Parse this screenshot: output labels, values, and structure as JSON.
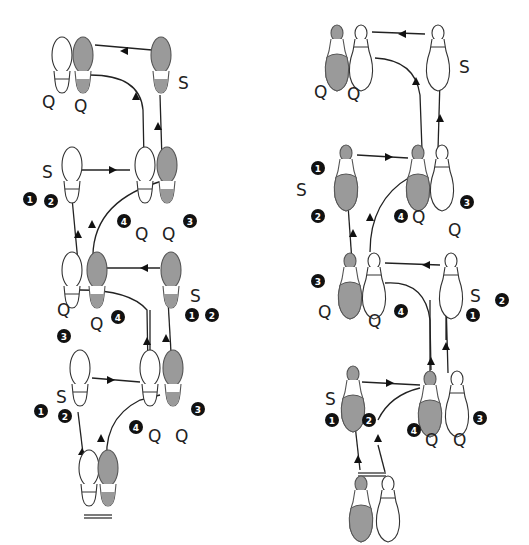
{
  "colors": {
    "gray_foot": "#9a9a9a",
    "white_foot": "#ffffff",
    "ink": "#222222"
  },
  "diagrams": [
    {
      "name": "leader-flat-shoes",
      "footprints": [
        {
          "id": "start-L",
          "x": 85,
          "y": 488,
          "fill": "white"
        },
        {
          "id": "start-R",
          "x": 108,
          "y": 488,
          "fill": "gray"
        },
        {
          "id": "s1-L",
          "x": 80,
          "y": 388,
          "fill": "white"
        },
        {
          "id": "q-L",
          "x": 150,
          "y": 395,
          "fill": "white"
        },
        {
          "id": "q-R",
          "x": 173,
          "y": 390,
          "fill": "gray"
        },
        {
          "id": "m2-L",
          "x": 72,
          "y": 285,
          "fill": "white"
        },
        {
          "id": "m2-R",
          "x": 96,
          "y": 282,
          "fill": "gray"
        },
        {
          "id": "m2-S",
          "x": 170,
          "y": 282,
          "fill": "gray"
        },
        {
          "id": "m3-S",
          "x": 70,
          "y": 180,
          "fill": "white"
        },
        {
          "id": "m3-L",
          "x": 143,
          "y": 180,
          "fill": "white"
        },
        {
          "id": "m3-R",
          "x": 166,
          "y": 180,
          "fill": "gray"
        },
        {
          "id": "top-L",
          "x": 62,
          "y": 80,
          "fill": "white"
        },
        {
          "id": "top-R",
          "x": 84,
          "y": 80,
          "fill": "gray"
        },
        {
          "id": "top-S",
          "x": 162,
          "y": 80,
          "fill": "gray"
        }
      ],
      "labels": [
        {
          "text": "Q",
          "x": 42,
          "y": 108
        },
        {
          "text": "Q",
          "x": 74,
          "y": 112
        },
        {
          "text": "S",
          "x": 178,
          "y": 89
        },
        {
          "text": "S",
          "x": 42,
          "y": 178
        },
        {
          "text": "Q",
          "x": 135,
          "y": 240
        },
        {
          "text": "Q",
          "x": 162,
          "y": 240
        },
        {
          "text": "Q",
          "x": 57,
          "y": 316
        },
        {
          "text": "Q",
          "x": 90,
          "y": 330
        },
        {
          "text": "S",
          "x": 190,
          "y": 302
        },
        {
          "text": "S",
          "x": 52,
          "y": 400
        },
        {
          "text": "Q",
          "x": 148,
          "y": 442
        },
        {
          "text": "Q",
          "x": 175,
          "y": 442
        }
      ],
      "numbers": [
        {
          "n": "1",
          "x": 30,
          "y": 199
        },
        {
          "n": "2",
          "x": 51,
          "y": 201
        },
        {
          "n": "4",
          "x": 124,
          "y": 219
        },
        {
          "n": "3",
          "x": 190,
          "y": 219
        },
        {
          "n": "4",
          "x": 118,
          "y": 321
        },
        {
          "n": "3",
          "x": 64,
          "y": 335
        },
        {
          "n": "1",
          "x": 190,
          "y": 315
        },
        {
          "n": "2",
          "x": 210,
          "y": 315
        },
        {
          "n": "1",
          "x": 41,
          "y": 411
        },
        {
          "n": "2",
          "x": 65,
          "y": 416
        },
        {
          "n": "4",
          "x": 136,
          "y": 427
        },
        {
          "n": "3",
          "x": 198,
          "y": 409
        }
      ]
    },
    {
      "name": "follower-heeled-shoes",
      "footprints": [
        {
          "id": "start-L",
          "x": 358,
          "y": 500,
          "fill": "gray"
        },
        {
          "id": "start-R",
          "x": 388,
          "y": 500,
          "fill": "white"
        },
        {
          "id": "s1",
          "x": 350,
          "y": 393,
          "fill": "gray"
        },
        {
          "id": "q-L",
          "x": 428,
          "y": 400,
          "fill": "gray"
        },
        {
          "id": "q-R",
          "x": 455,
          "y": 400,
          "fill": "white"
        },
        {
          "id": "m2-L",
          "x": 350,
          "y": 280,
          "fill": "gray"
        },
        {
          "id": "m2-R",
          "x": 370,
          "y": 280,
          "fill": "white"
        },
        {
          "id": "m2-S",
          "x": 450,
          "y": 282,
          "fill": "white"
        },
        {
          "id": "m3-S",
          "x": 345,
          "y": 175,
          "fill": "gray"
        },
        {
          "id": "m3-L",
          "x": 418,
          "y": 175,
          "fill": "gray"
        },
        {
          "id": "m3-R",
          "x": 441,
          "y": 175,
          "fill": "white"
        },
        {
          "id": "top-L",
          "x": 338,
          "y": 60,
          "fill": "gray"
        },
        {
          "id": "top-R",
          "x": 362,
          "y": 60,
          "fill": "white"
        },
        {
          "id": "top-S",
          "x": 438,
          "y": 60,
          "fill": "white"
        }
      ],
      "labels": [
        {
          "text": "Q",
          "x": 314,
          "y": 98
        },
        {
          "text": "Q",
          "x": 347,
          "y": 100
        },
        {
          "text": "S",
          "x": 459,
          "y": 73
        },
        {
          "text": "S",
          "x": 296,
          "y": 196
        },
        {
          "text": "Q",
          "x": 412,
          "y": 223
        },
        {
          "text": "Q",
          "x": 448,
          "y": 236
        },
        {
          "text": "Q",
          "x": 318,
          "y": 318
        },
        {
          "text": "Q",
          "x": 368,
          "y": 327
        },
        {
          "text": "S",
          "x": 470,
          "y": 302
        },
        {
          "text": "S",
          "x": 325,
          "y": 405
        },
        {
          "text": "Q",
          "x": 425,
          "y": 446
        },
        {
          "text": "Q",
          "x": 453,
          "y": 446
        }
      ],
      "numbers": [
        {
          "n": "1",
          "x": 318,
          "y": 168
        },
        {
          "n": "2",
          "x": 318,
          "y": 216
        },
        {
          "n": "4",
          "x": 401,
          "y": 216
        },
        {
          "n": "3",
          "x": 467,
          "y": 202
        },
        {
          "n": "3",
          "x": 318,
          "y": 281
        },
        {
          "n": "4",
          "x": 401,
          "y": 311
        },
        {
          "n": "2",
          "x": 502,
          "y": 300
        },
        {
          "n": "1",
          "x": 473,
          "y": 315
        },
        {
          "n": "1",
          "x": 332,
          "y": 420
        },
        {
          "n": "2",
          "x": 369,
          "y": 420
        },
        {
          "n": "4",
          "x": 414,
          "y": 430
        },
        {
          "n": "3",
          "x": 480,
          "y": 418
        }
      ]
    }
  ]
}
